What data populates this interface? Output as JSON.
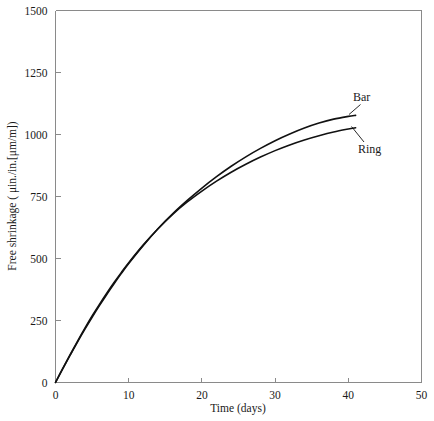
{
  "chart_data": {
    "type": "line",
    "title": "",
    "subtitle": "",
    "xlabel": "Time (days)",
    "ylabel": "Free shrinkage ( μin./in.[μm/m])",
    "xlim": [
      0,
      50
    ],
    "ylim": [
      0,
      1500
    ],
    "xticks": [
      0,
      10,
      20,
      30,
      40,
      50
    ],
    "yticks": [
      0,
      250,
      500,
      750,
      1000,
      1250,
      1500
    ],
    "xtick_labels": [
      "0",
      "10",
      "20",
      "30",
      "40",
      "50"
    ],
    "ytick_labels": [
      "0",
      "250",
      "500",
      "750",
      "1000",
      "1250",
      "1500"
    ],
    "grid": false,
    "legend_position": "inline-annotations",
    "series": [
      {
        "name": "Bar",
        "color": "#111111",
        "x": [
          0,
          1,
          2,
          3,
          4,
          5,
          6,
          7,
          8,
          9,
          10,
          12,
          14,
          16,
          18,
          20,
          22,
          24,
          26,
          28,
          30,
          32,
          34,
          36,
          38,
          40,
          41
        ],
        "values": [
          0,
          56,
          110,
          163,
          214,
          263,
          310,
          355,
          398,
          440,
          480,
          553,
          620,
          680,
          734,
          784,
          830,
          872,
          910,
          944,
          975,
          1002,
          1026,
          1046,
          1062,
          1073,
          1077
        ]
      },
      {
        "name": "Ring",
        "color": "#111111",
        "x": [
          0,
          1,
          2,
          3,
          4,
          5,
          6,
          7,
          8,
          9,
          10,
          12,
          14,
          16,
          18,
          20,
          22,
          24,
          26,
          28,
          30,
          32,
          34,
          36,
          38,
          40,
          41
        ],
        "values": [
          0,
          57,
          112,
          166,
          218,
          268,
          315,
          360,
          403,
          444,
          483,
          555,
          620,
          678,
          728,
          772,
          812,
          848,
          880,
          909,
          935,
          958,
          978,
          995,
          1010,
          1022,
          1027
        ]
      }
    ],
    "annotations": [
      {
        "text": "Bar",
        "series": "Bar",
        "x": 41,
        "y": 1077
      },
      {
        "text": "Ring",
        "series": "Ring",
        "x": 41,
        "y": 1027
      }
    ]
  }
}
